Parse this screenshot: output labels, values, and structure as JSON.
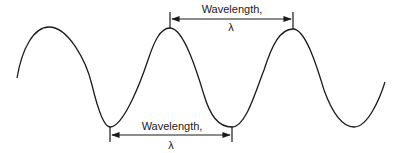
{
  "diagram": {
    "stroke_color": "#1a1a1a",
    "top_annotation": {
      "label": "Wavelength,",
      "symbol": "λ",
      "measured_between": "adjacent crests"
    },
    "bottom_annotation": {
      "label": "Wavelength,",
      "symbol": "λ",
      "measured_between": "adjacent troughs"
    }
  }
}
